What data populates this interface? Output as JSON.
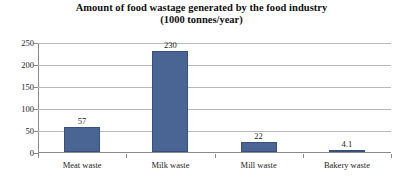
{
  "chart_data": {
    "type": "bar",
    "title": "Amount of food wastage generated by the food industry",
    "subtitle": "(1000 tonnes/year)",
    "xlabel": "",
    "ylabel": "",
    "categories": [
      "Meat waste",
      "Milk waste",
      "Mill waste",
      "Bakery waste"
    ],
    "values": [
      57,
      230,
      22,
      4.1
    ],
    "value_labels": [
      "57",
      "230",
      "22",
      "4.1"
    ],
    "ylim": [
      0,
      250
    ],
    "yticks": [
      0,
      50,
      100,
      150,
      200,
      250
    ],
    "ytick_labels": [
      "0",
      "50",
      "100",
      "150",
      "200",
      "250"
    ],
    "grid": "horizontal",
    "legend": "none",
    "series": [
      {
        "name": "Food wastage",
        "values": [
          57,
          230,
          22,
          4.1
        ]
      }
    ]
  },
  "style": {
    "bar_color": "#4a6494",
    "bar_edge_color": "#36507f",
    "grid_color": "#b9b9b9",
    "axis_color": "#8a8a8a",
    "background": "#ffffff",
    "text_color": "#1c1c1c"
  }
}
